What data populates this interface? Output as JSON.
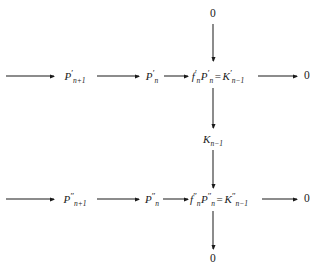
{
  "diagram": {
    "type": "commutative-diagram",
    "background_color": "#ffffff",
    "ink_color": "#1a1a1a",
    "nodes": {
      "top_zero": "0",
      "bottom_zero": "0",
      "middle_k": {
        "base": "K",
        "sub": "n−1"
      },
      "row1": {
        "p_np1": {
          "base": "P",
          "sup": "′",
          "sub": "n+1"
        },
        "p_n": {
          "base": "P",
          "sup": "′",
          "sub": "n"
        },
        "center_f": {
          "base": "f",
          "sup": "′",
          "sub": "n"
        },
        "center_p": {
          "base": "P",
          "sup": "′",
          "sub": "n"
        },
        "equals": "=",
        "center_k": {
          "base": "K",
          "sup": "′",
          "sub": "n−1"
        },
        "end_zero": "0"
      },
      "row2": {
        "p_np1": {
          "base": "P",
          "sup": "″",
          "sub": "n+1"
        },
        "p_n": {
          "base": "P",
          "sup": "″",
          "sub": "n"
        },
        "center_f": {
          "base": "f",
          "sup": "″",
          "sub": "n"
        },
        "center_p": {
          "base": "P",
          "sup": "″",
          "sub": "n"
        },
        "equals": "=",
        "center_k": {
          "base": "K",
          "sup": "″",
          "sub": "n−1"
        },
        "end_zero": "0"
      }
    }
  }
}
